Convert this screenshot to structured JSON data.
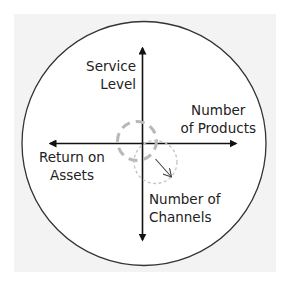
{
  "diagram": {
    "axes": {
      "up": {
        "line1": "Service",
        "line2": "Level"
      },
      "right": {
        "line1": "Number",
        "line2": "of Products"
      },
      "left": {
        "line1": "Return on",
        "line2": "Assets"
      },
      "down": {
        "line1": "Number of",
        "line2": "Channels"
      }
    },
    "colors": {
      "panel_background": "#f3f3f3",
      "circle_fill": "#ffffff",
      "circle_stroke": "#333333",
      "axis": "#111111",
      "dashed_current": "#b8b8b8",
      "dashed_target": "#c4c4c4",
      "shift_arrow": "#444444",
      "text": "#222222"
    }
  }
}
